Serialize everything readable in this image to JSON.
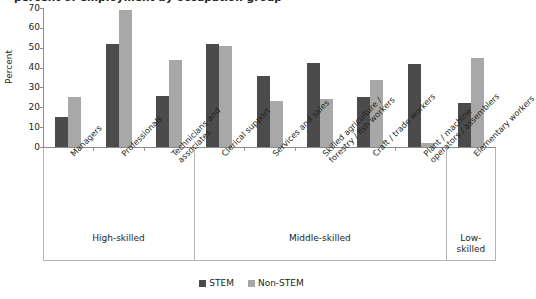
{
  "chart_data": {
    "type": "bar",
    "title": "",
    "xlabel": "",
    "ylabel": "Percent",
    "ylim": [
      0,
      70
    ],
    "yticks": [
      0,
      10,
      20,
      30,
      40,
      50,
      60,
      70
    ],
    "grid": false,
    "legend_position": "bottom-center",
    "categories": [
      "Managers",
      "Professionals",
      "Technicians and\nassociates",
      "Clerical support",
      "Services and sales",
      "Skilled agriculture /\nforestry / fish workers",
      "Craft / trade workers",
      "Plant / machine\noperators / assemblers",
      "Elementary workers"
    ],
    "series": [
      {
        "name": "STEM",
        "color": "#4b4b4b",
        "values": [
          15,
          52,
          25.5,
          52,
          36,
          42.5,
          25,
          42,
          22
        ]
      },
      {
        "name": "Non-STEM",
        "color": "#a8a8a8",
        "values": [
          25,
          69,
          44,
          51,
          23,
          24,
          34,
          2,
          45
        ]
      }
    ],
    "groups": [
      {
        "label": "High-skilled",
        "categories": 3
      },
      {
        "label": "Middle-skilled",
        "categories": 5
      },
      {
        "label": "Low-\nskilled",
        "categories": 1
      }
    ]
  },
  "legend": {
    "items": [
      {
        "label": "STEM",
        "swatch": "stem"
      },
      {
        "label": "Non-STEM",
        "swatch": "nonstem"
      }
    ]
  },
  "title_sliver": "percent of employment by occupation group"
}
